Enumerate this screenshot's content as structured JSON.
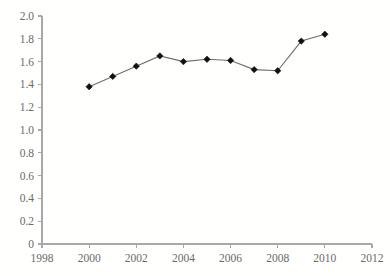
{
  "chart_data": {
    "type": "line",
    "title": "",
    "xlabel": "",
    "ylabel": "",
    "x": [
      2000,
      2001,
      2002,
      2003,
      2004,
      2005,
      2006,
      2007,
      2008,
      2009,
      2010
    ],
    "values": [
      1.38,
      1.47,
      1.56,
      1.65,
      1.6,
      1.62,
      1.61,
      1.53,
      1.52,
      1.78,
      1.84
    ],
    "series": [
      {
        "name": "",
        "values": [
          1.38,
          1.47,
          1.56,
          1.65,
          1.6,
          1.62,
          1.61,
          1.53,
          1.52,
          1.78,
          1.84
        ]
      }
    ],
    "xlim": [
      1998,
      2012
    ],
    "ylim": [
      0,
      2.0
    ],
    "xticks": [
      1998,
      2000,
      2002,
      2004,
      2006,
      2008,
      2010,
      2012
    ],
    "xtick_labels": [
      "1998",
      "2000",
      "2002",
      "2004",
      "2006",
      "2008",
      "2010",
      "2012"
    ],
    "yticks": [
      0,
      0.2,
      0.4,
      0.6,
      0.8,
      1.0,
      1.2,
      1.4,
      1.6,
      1.8,
      2.0
    ],
    "ytick_labels": [
      "0",
      "0.2",
      "0.4",
      "0.6",
      "0.8",
      "1.0",
      "1.2",
      "1.4",
      "1.6",
      "1.8",
      "2.0"
    ],
    "grid": false,
    "legend": false,
    "legend_position": "none",
    "marker": "diamond",
    "line_color": "#6e6e6e",
    "marker_color": "#111111",
    "axis_color": "#a8a8a8",
    "background_color": "#ffffff",
    "annotations": []
  }
}
